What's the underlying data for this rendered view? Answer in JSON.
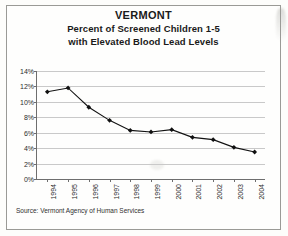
{
  "document": {
    "source_note": "Source: Vermont Agency of Human Services"
  },
  "chart_data": {
    "type": "line",
    "title": "VERMONT",
    "subtitle_line1": "Percent of Screened Children 1-5",
    "subtitle_line2": "with Elevated Blood Lead Levels",
    "xlabel": "",
    "ylabel": "",
    "categories": [
      "1994",
      "1995",
      "1996",
      "1997",
      "1998",
      "1999",
      "2000",
      "2001",
      "2002",
      "2003",
      "2004"
    ],
    "values": [
      11.3,
      11.8,
      9.3,
      7.6,
      6.3,
      6.1,
      6.4,
      5.4,
      5.1,
      4.1,
      3.5
    ],
    "ytick_labels": [
      "14%",
      "12%",
      "10%",
      "8%",
      "6%",
      "4%",
      "2%",
      "0%"
    ],
    "ytick_values": [
      14,
      12,
      10,
      8,
      6,
      4,
      2,
      0
    ],
    "ylim": [
      0,
      14
    ],
    "grid": true,
    "legend": "none",
    "series_color": "#111111",
    "marker": "diamond",
    "grid_color": "#c9c9c9",
    "axis_color": "#6e6e6e"
  }
}
